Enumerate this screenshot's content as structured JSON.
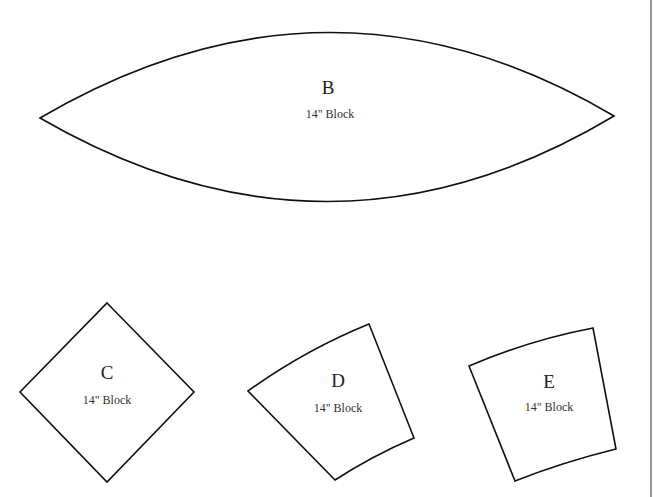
{
  "pieces": [
    {
      "id": "B",
      "letter": "B",
      "size_label": "14\" Block",
      "shape": "melon"
    },
    {
      "id": "C",
      "letter": "C",
      "size_label": "14\" Block",
      "shape": "diamond"
    },
    {
      "id": "D",
      "letter": "D",
      "size_label": "14\" Block",
      "shape": "curved-quadrilateral"
    },
    {
      "id": "E",
      "letter": "E",
      "size_label": "14\" Block",
      "shape": "curved-quadrilateral"
    }
  ],
  "colors": {
    "outline": "#111111",
    "fill": "#ffffff",
    "page_border": "#777777"
  }
}
